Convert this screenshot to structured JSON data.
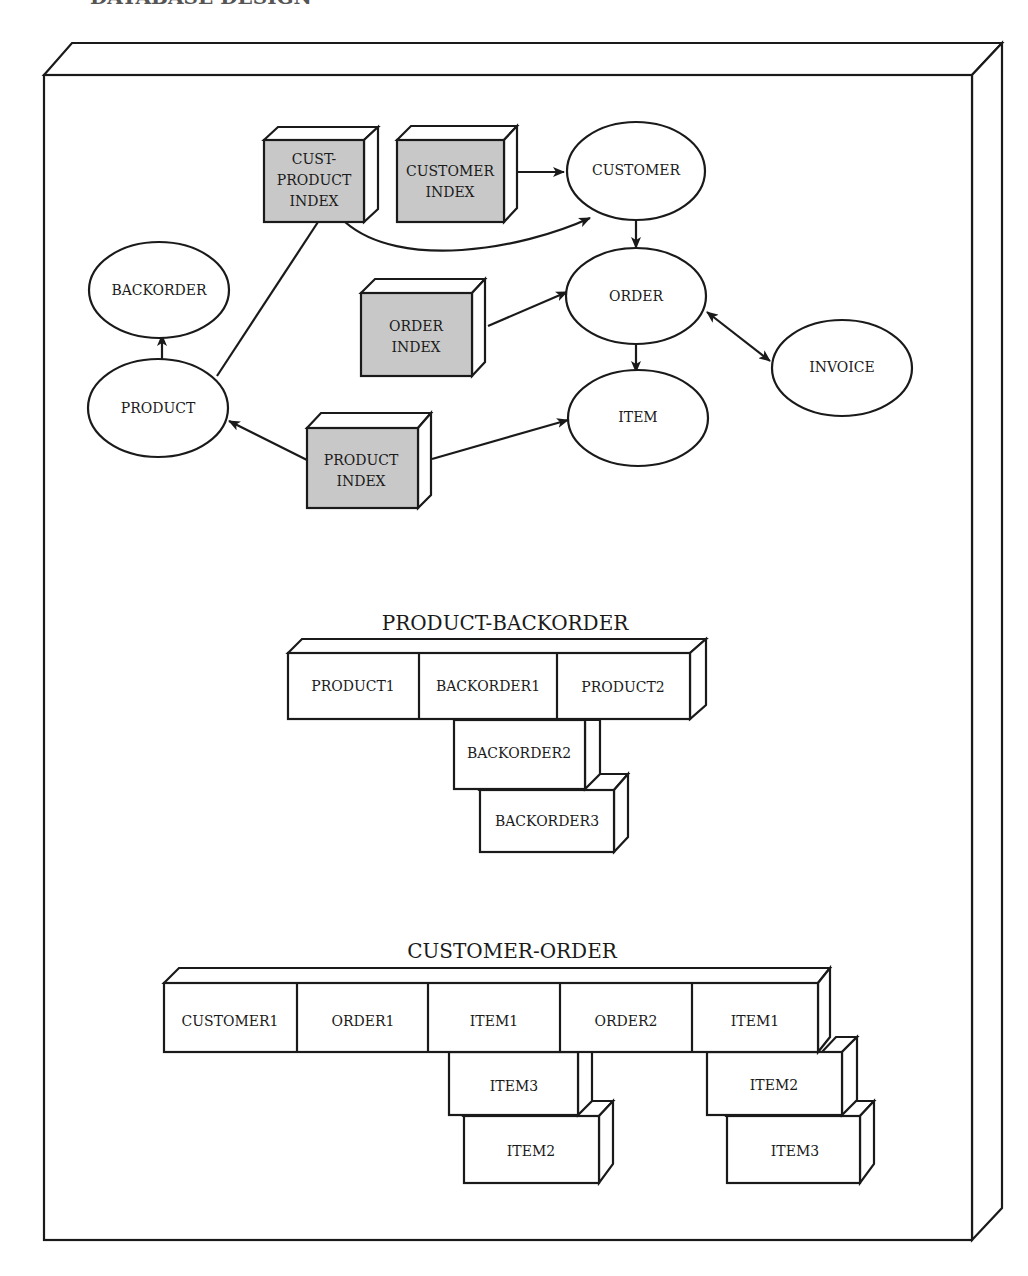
{
  "header": {
    "text": "DATABASE DESIGN"
  },
  "colors": {
    "index_fill": "#c8c8c8",
    "line": "#1a1a1a",
    "background": "#ffffff"
  },
  "network": {
    "indexes": {
      "cust_product_index": "CUST-|PRODUCT|INDEX",
      "customer_index": "CUSTOMER|INDEX",
      "order_index": "ORDER|INDEX",
      "product_index": "PRODUCT|INDEX"
    },
    "records": {
      "customer": "CUSTOMER",
      "order": "ORDER",
      "item": "ITEM",
      "invoice": "INVOICE",
      "backorder": "BACKORDER",
      "product": "PRODUCT"
    },
    "edges": [
      {
        "from": "CUSTOMER INDEX",
        "to": "CUSTOMER"
      },
      {
        "from": "CUST-PRODUCT INDEX",
        "to": "CUSTOMER"
      },
      {
        "from": "CUST-PRODUCT INDEX",
        "to": "PRODUCT",
        "arrow": false
      },
      {
        "from": "CUSTOMER",
        "to": "ORDER"
      },
      {
        "from": "ORDER INDEX",
        "to": "ORDER"
      },
      {
        "from": "ORDER",
        "to": "ITEM"
      },
      {
        "from": "ORDER",
        "to": "INVOICE",
        "bidirectional": true
      },
      {
        "from": "PRODUCT",
        "to": "BACKORDER"
      },
      {
        "from": "PRODUCT INDEX",
        "to": "PRODUCT"
      },
      {
        "from": "PRODUCT INDEX",
        "to": "ITEM"
      }
    ]
  },
  "product_backorder": {
    "title": "PRODUCT-BACKORDER",
    "row": [
      "PRODUCT1",
      "BACKORDER1",
      "PRODUCT2"
    ],
    "stack": [
      "BACKORDER2",
      "BACKORDER3"
    ]
  },
  "customer_order": {
    "title": "CUSTOMER-ORDER",
    "row": [
      "CUSTOMER1",
      "ORDER1",
      "ITEM1",
      "ORDER2",
      "ITEM1"
    ],
    "stack_left": [
      "ITEM3",
      "ITEM2"
    ],
    "stack_right": [
      "ITEM2",
      "ITEM3"
    ]
  }
}
